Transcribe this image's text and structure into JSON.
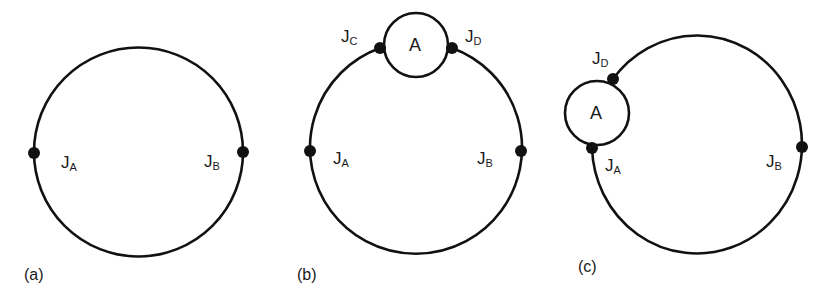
{
  "figure": {
    "panels": [
      {
        "caption": "(a)",
        "junctions": [
          {
            "main": "J",
            "sub": "A"
          },
          {
            "main": "J",
            "sub": "B"
          }
        ]
      },
      {
        "caption": "(b)",
        "node": "A",
        "junctions": [
          {
            "main": "J",
            "sub": "C"
          },
          {
            "main": "J",
            "sub": "D"
          },
          {
            "main": "J",
            "sub": "A"
          },
          {
            "main": "J",
            "sub": "B"
          }
        ]
      },
      {
        "caption": "(c)",
        "node": "A",
        "junctions": [
          {
            "main": "J",
            "sub": "D"
          },
          {
            "main": "J",
            "sub": "A"
          },
          {
            "main": "J",
            "sub": "B"
          }
        ]
      }
    ],
    "colors": {
      "stroke": "#111111",
      "background": "#ffffff"
    }
  }
}
